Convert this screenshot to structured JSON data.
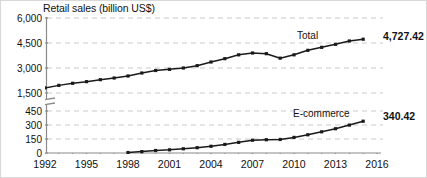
{
  "chart_data": {
    "type": "line",
    "title": "Retail sales (billion US$)",
    "xlabel": "",
    "ylabel": "Retail sales (billion US$)",
    "grid": true,
    "legend_position": "inline-annotation",
    "broken_axis": true,
    "axis_break_note": "y-axis broken between 450 and 1,500",
    "x": [
      1992,
      1993,
      1994,
      1995,
      1996,
      1997,
      1998,
      1999,
      2000,
      2001,
      2002,
      2003,
      2004,
      2005,
      2006,
      2007,
      2008,
      2009,
      2010,
      2011,
      2012,
      2013,
      2014,
      2015
    ],
    "xlim": [
      1992,
      2016
    ],
    "x_tick_labels": [
      "1992",
      "1995",
      "1998",
      "2001",
      "2004",
      "2007",
      "2010",
      "2013",
      "2016"
    ],
    "upper_panel": {
      "y_tick_labels": [
        "1,500",
        "3,000",
        "4,500",
        "6,000"
      ],
      "y_ticks": [
        1500,
        3000,
        4500,
        6000
      ],
      "ylim": [
        1500,
        6000
      ]
    },
    "lower_panel": {
      "y_tick_labels": [
        "0",
        "150",
        "300",
        "450"
      ],
      "y_ticks": [
        0,
        150,
        300,
        450
      ],
      "ylim": [
        0,
        450
      ]
    },
    "series": [
      {
        "name": "Total",
        "panel": "upper",
        "end_value_label": "4,727.42",
        "x": [
          1992,
          1993,
          1994,
          1995,
          1996,
          1997,
          1998,
          1999,
          2000,
          2001,
          2002,
          2003,
          2004,
          2005,
          2006,
          2007,
          2008,
          2009,
          2010,
          2011,
          2012,
          2013,
          2014,
          2015
        ],
        "values": [
          1806,
          1958,
          2083,
          2180,
          2300,
          2400,
          2520,
          2700,
          2850,
          2920,
          3000,
          3140,
          3360,
          3560,
          3790,
          3900,
          3860,
          3590,
          3790,
          4060,
          4240,
          4420,
          4620,
          4727.42
        ]
      },
      {
        "name": "E-commerce",
        "panel": "lower",
        "end_value_label": "340.42",
        "x": [
          1998,
          1999,
          2000,
          2001,
          2002,
          2003,
          2004,
          2005,
          2006,
          2007,
          2008,
          2009,
          2010,
          2011,
          2012,
          2013,
          2014,
          2015
        ],
        "values": [
          5,
          15,
          27,
          34,
          45,
          57,
          72,
          92,
          114,
          137,
          142,
          145,
          167,
          195,
          227,
          260,
          299,
          340.42
        ]
      }
    ]
  },
  "annotations": {
    "total_label": "Total",
    "total_end_value": "4,727.42",
    "ecommerce_label": "E-commerce",
    "ecommerce_end_value": "340.42"
  },
  "colors": {
    "line": "#1a1a1a",
    "grid": "#c9c9c9",
    "axis": "#8a8a8a",
    "text": "#111111",
    "background": "#ffffff",
    "frame": "#d8d8d8"
  }
}
